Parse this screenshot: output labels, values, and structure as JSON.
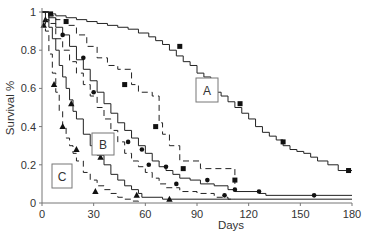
{
  "chart_data": {
    "type": "line",
    "subtype": "kaplan-meier step",
    "title": "",
    "xlabel": "Days",
    "ylabel": "Survival %",
    "xlim": [
      0,
      180
    ],
    "ylim": [
      0,
      1
    ],
    "xticks": [
      0,
      30,
      60,
      90,
      120,
      150,
      180
    ],
    "yticks": [
      0,
      0.2,
      0.4,
      0.6,
      0.8,
      1
    ],
    "ytick_labels": [
      "0",
      "0.2",
      "0.4",
      "0.6",
      "0.8",
      "1"
    ],
    "grid": false,
    "legend": "none (boxed group labels A, B, C in plot)",
    "annotations": [
      {
        "text": "A",
        "x": 92,
        "y": 0.56
      },
      {
        "text": "B",
        "x": 58,
        "y": 0.3
      },
      {
        "text": "C",
        "x": 12,
        "y": 0.13
      }
    ],
    "series": [
      {
        "name": "A solid",
        "group": "A",
        "style": "solid",
        "marker": "square",
        "x": [
          0,
          4,
          8,
          14,
          20,
          26,
          32,
          38,
          44,
          50,
          56,
          62,
          66,
          70,
          74,
          78,
          82,
          86,
          90,
          94,
          98,
          100,
          104,
          108,
          112,
          116,
          120,
          124,
          128,
          132,
          136,
          140,
          144,
          148,
          152,
          156,
          160,
          166,
          172,
          180
        ],
        "y": [
          1.0,
          0.99,
          0.98,
          0.97,
          0.96,
          0.95,
          0.94,
          0.93,
          0.92,
          0.91,
          0.89,
          0.87,
          0.85,
          0.83,
          0.8,
          0.77,
          0.74,
          0.72,
          0.68,
          0.66,
          0.64,
          0.58,
          0.56,
          0.53,
          0.5,
          0.47,
          0.44,
          0.4,
          0.37,
          0.35,
          0.33,
          0.3,
          0.28,
          0.27,
          0.26,
          0.24,
          0.22,
          0.2,
          0.17,
          0.17
        ],
        "markers_x": [
          5,
          80,
          115,
          140,
          178
        ],
        "markers_y": [
          0.99,
          0.82,
          0.52,
          0.32,
          0.17
        ]
      },
      {
        "name": "A dashed",
        "group": "A",
        "style": "dashed",
        "marker": "square",
        "x": [
          0,
          4,
          8,
          14,
          20,
          26,
          32,
          38,
          44,
          52,
          56,
          64,
          68,
          70,
          74,
          80,
          92,
          112
        ],
        "y": [
          1.0,
          0.98,
          0.96,
          0.93,
          0.88,
          0.82,
          0.76,
          0.72,
          0.7,
          0.62,
          0.58,
          0.56,
          0.42,
          0.36,
          0.3,
          0.22,
          0.18,
          0.1
        ],
        "markers_x": [
          14,
          48,
          66,
          82,
          112
        ],
        "markers_y": [
          0.95,
          0.62,
          0.4,
          0.18,
          0.12
        ]
      },
      {
        "name": "B solid",
        "group": "B",
        "style": "solid",
        "marker": "circle",
        "x": [
          0,
          4,
          8,
          12,
          16,
          20,
          24,
          28,
          32,
          36,
          40,
          44,
          48,
          52,
          56,
          60,
          64,
          68,
          72,
          76,
          80,
          86,
          92,
          100,
          108,
          112,
          126,
          130,
          180
        ],
        "y": [
          1.0,
          0.97,
          0.92,
          0.88,
          0.82,
          0.75,
          0.7,
          0.64,
          0.58,
          0.52,
          0.47,
          0.42,
          0.38,
          0.34,
          0.3,
          0.26,
          0.22,
          0.19,
          0.17,
          0.15,
          0.13,
          0.12,
          0.1,
          0.09,
          0.07,
          0.06,
          0.05,
          0.04,
          0.04
        ],
        "markers_x": [
          30,
          58,
          72,
          96,
          112,
          126,
          158
        ],
        "markers_y": [
          0.58,
          0.28,
          0.19,
          0.12,
          0.07,
          0.06,
          0.04
        ]
      },
      {
        "name": "B dashed",
        "group": "B",
        "style": "dashed",
        "marker": "circle",
        "x": [
          0,
          4,
          8,
          12,
          16,
          20,
          24,
          28,
          32,
          36,
          40,
          44,
          48,
          52,
          56,
          60,
          64,
          68,
          72,
          80,
          90,
          100,
          108,
          112
        ],
        "y": [
          1.0,
          0.94,
          0.86,
          0.8,
          0.74,
          0.68,
          0.62,
          0.56,
          0.5,
          0.44,
          0.38,
          0.32,
          0.26,
          0.22,
          0.19,
          0.16,
          0.13,
          0.1,
          0.08,
          0.06,
          0.05,
          0.03,
          0.02,
          0.02
        ],
        "markers_x": [
          12,
          24,
          50,
          62,
          78,
          106
        ],
        "markers_y": [
          0.88,
          0.76,
          0.32,
          0.2,
          0.1,
          0.04
        ]
      },
      {
        "name": "C solid",
        "group": "C",
        "style": "solid",
        "marker": "triangle",
        "x": [
          0,
          2,
          4,
          6,
          8,
          10,
          12,
          14,
          16,
          18,
          20,
          24,
          28,
          32,
          36,
          40,
          44,
          48,
          52,
          56,
          58,
          70,
          180
        ],
        "y": [
          1.0,
          0.96,
          0.92,
          0.86,
          0.8,
          0.72,
          0.66,
          0.6,
          0.54,
          0.48,
          0.44,
          0.36,
          0.3,
          0.25,
          0.2,
          0.15,
          0.12,
          0.09,
          0.07,
          0.05,
          0.03,
          0.02,
          0.02
        ],
        "markers_x": [
          2,
          17,
          34,
          55,
          74
        ],
        "markers_y": [
          0.96,
          0.52,
          0.24,
          0.04,
          0.02
        ]
      },
      {
        "name": "C dashed",
        "group": "C",
        "style": "dashed",
        "marker": "triangle",
        "x": [
          0,
          2,
          4,
          6,
          8,
          10,
          12,
          14,
          16,
          18,
          20,
          24,
          28,
          32,
          36,
          40,
          44,
          48,
          52,
          56
        ],
        "y": [
          1.0,
          0.9,
          0.78,
          0.68,
          0.58,
          0.48,
          0.4,
          0.34,
          0.3,
          0.26,
          0.22,
          0.16,
          0.12,
          0.09,
          0.07,
          0.05,
          0.03,
          0.02,
          0.01,
          0.0
        ],
        "markers_x": [
          1,
          7,
          12,
          20,
          31
        ],
        "markers_y": [
          0.93,
          0.62,
          0.4,
          0.28,
          0.06
        ]
      }
    ]
  },
  "labels": {
    "xlabel": "Days",
    "ylabel": "Survival %",
    "group_a": "A",
    "group_b": "B",
    "group_c": "C"
  }
}
